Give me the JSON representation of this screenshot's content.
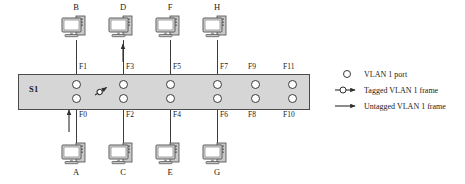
{
  "diagram": {
    "switch": {
      "name": "S1",
      "accent_color": "#d6d6d6",
      "border_color": "#4c4c4c"
    },
    "top_ports": [
      {
        "id": "F1",
        "x": 76
      },
      {
        "id": "F3",
        "x": 123
      },
      {
        "id": "F5",
        "x": 170
      },
      {
        "id": "F7",
        "x": 217
      },
      {
        "id": "F9",
        "x": 255
      },
      {
        "id": "F11",
        "x": 292
      }
    ],
    "bottom_ports": [
      {
        "id": "F0",
        "x": 76
      },
      {
        "id": "F2",
        "x": 123
      },
      {
        "id": "F4",
        "x": 170
      },
      {
        "id": "F6",
        "x": 217
      },
      {
        "id": "F8",
        "x": 255
      },
      {
        "id": "F10",
        "x": 292
      }
    ],
    "top_hosts": [
      {
        "label": "B",
        "port": "F1",
        "x": 76,
        "arrow": false
      },
      {
        "label": "D",
        "port": "F3",
        "x": 123,
        "arrow": true
      },
      {
        "label": "F",
        "port": "F5",
        "x": 170,
        "arrow": false
      },
      {
        "label": "H",
        "port": "F7",
        "x": 217,
        "arrow": false
      }
    ],
    "bottom_hosts": [
      {
        "label": "A",
        "port": "F0",
        "x": 76,
        "arrow": true
      },
      {
        "label": "C",
        "port": "F2",
        "x": 123,
        "arrow": false
      },
      {
        "label": "E",
        "port": "F4",
        "x": 170,
        "arrow": false
      },
      {
        "label": "G",
        "port": "F6",
        "x": 217,
        "arrow": false
      }
    ],
    "internal_tagged_marker": {
      "name": "tagged-frame-marker",
      "x": 101,
      "y": 90
    }
  },
  "legend": {
    "items": [
      {
        "symbol": "vlan-port-circle",
        "text": "VLAN 1 port"
      },
      {
        "symbol": "tagged-frame-arrow",
        "text": "Tagged VLAN 1 frame"
      },
      {
        "symbol": "untagged-frame-arrow",
        "text": "Untagged VLAN 1 frame"
      }
    ]
  }
}
